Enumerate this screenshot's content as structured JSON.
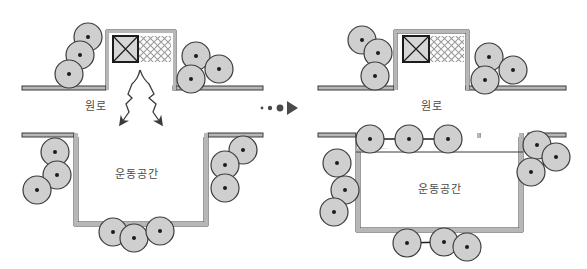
{
  "figure": {
    "type": "architectural-section-diagram",
    "panel_count": 2,
    "transition_marker": "dots-and-arrow"
  },
  "colors": {
    "outline": "#3b3b3b",
    "wall_fill": "#b7b7b7",
    "circle_fill": "#cfcfcf",
    "circle_stroke": "#3b3b3b",
    "text": "#4a4a4a",
    "hatch": "#9a9a9a",
    "background": "#ffffff",
    "arrow_stroke": "#3b3b3b"
  },
  "panels": [
    {
      "id": "left-panel",
      "name": "before-state",
      "upper": {
        "label": "원로",
        "box_label_icon": "crossed-square-icon",
        "hatch_region_name": "mesh-hatch-panel",
        "circle_clusters": [
          {
            "name": "upper-left-cluster",
            "count": 3,
            "circles": [
              {
                "cx": 88,
                "cy": 37,
                "r": 14
              },
              {
                "cx": 80,
                "cy": 55,
                "r": 14
              },
              {
                "cx": 69,
                "cy": 74,
                "r": 14
              }
            ],
            "links": [
              [
                0,
                1
              ],
              [
                1,
                2
              ]
            ]
          },
          {
            "name": "upper-right-cluster",
            "count": 3,
            "circles": [
              {
                "cx": 196,
                "cy": 56,
                "r": 14
              },
              {
                "cx": 191,
                "cy": 79,
                "r": 14
              },
              {
                "cx": 219,
                "cy": 69,
                "r": 14
              }
            ],
            "links": [
              [
                0,
                1
              ],
              [
                0,
                2
              ]
            ]
          }
        ],
        "arrows": [
          {
            "name": "zigzag-arrow-left",
            "direction": "down-left"
          },
          {
            "name": "zigzag-arrow-right",
            "direction": "down-right"
          }
        ]
      },
      "lower": {
        "label": "운동공간",
        "has_top_shelf": false,
        "circle_clusters": [
          {
            "name": "lower-left-cluster",
            "count": 3,
            "circles": [
              {
                "cx": 55,
                "cy": 152,
                "r": 14
              },
              {
                "cx": 57,
                "cy": 175,
                "r": 14
              },
              {
                "cx": 37,
                "cy": 190,
                "r": 14
              }
            ],
            "links": [
              [
                0,
                1
              ],
              [
                1,
                2
              ]
            ]
          },
          {
            "name": "lower-right-cluster",
            "count": 3,
            "circles": [
              {
                "cx": 243,
                "cy": 150,
                "r": 14
              },
              {
                "cx": 225,
                "cy": 165,
                "r": 14
              },
              {
                "cx": 225,
                "cy": 188,
                "r": 14
              }
            ],
            "links": [
              [
                0,
                1
              ],
              [
                1,
                2
              ]
            ]
          },
          {
            "name": "lower-bottom-cluster",
            "count": 3,
            "circles": [
              {
                "cx": 113,
                "cy": 232,
                "r": 14
              },
              {
                "cx": 134,
                "cy": 238,
                "r": 14
              },
              {
                "cx": 160,
                "cy": 231,
                "r": 14
              }
            ],
            "links": [
              [
                0,
                1
              ],
              [
                1,
                2
              ]
            ]
          }
        ]
      }
    },
    {
      "id": "right-panel",
      "name": "after-state",
      "upper": {
        "label": "원로",
        "box_label_icon": "crossed-square-icon",
        "hatch_region_name": "mesh-hatch-panel",
        "circle_clusters": [
          {
            "name": "upper-left-cluster",
            "count": 3,
            "circles": [
              {
                "cx": 362,
                "cy": 40,
                "r": 14
              },
              {
                "cx": 378,
                "cy": 53,
                "r": 14
              },
              {
                "cx": 375,
                "cy": 76,
                "r": 14
              }
            ],
            "links": [
              [
                0,
                1
              ],
              [
                1,
                2
              ]
            ]
          },
          {
            "name": "upper-right-cluster",
            "count": 3,
            "circles": [
              {
                "cx": 489,
                "cy": 57,
                "r": 14
              },
              {
                "cx": 485,
                "cy": 80,
                "r": 14
              },
              {
                "cx": 513,
                "cy": 70,
                "r": 14
              }
            ],
            "links": [
              [
                0,
                1
              ],
              [
                0,
                2
              ]
            ]
          }
        ],
        "arrows": []
      },
      "lower": {
        "label": "운동공간",
        "has_top_shelf": true,
        "circle_clusters": [
          {
            "name": "shelf-row-cluster",
            "count": 3,
            "circles": [
              {
                "cx": 370,
                "cy": 139,
                "r": 14
              },
              {
                "cx": 409,
                "cy": 139,
                "r": 14
              },
              {
                "cx": 448,
                "cy": 139,
                "r": 14
              }
            ],
            "links": [
              [
                0,
                1
              ],
              [
                1,
                2
              ]
            ]
          },
          {
            "name": "lower-left-cluster",
            "count": 3,
            "circles": [
              {
                "cx": 337,
                "cy": 163,
                "r": 14
              },
              {
                "cx": 345,
                "cy": 190,
                "r": 14
              },
              {
                "cx": 334,
                "cy": 212,
                "r": 14
              }
            ],
            "links": [
              [
                0,
                1
              ],
              [
                1,
                2
              ]
            ]
          },
          {
            "name": "lower-right-cluster",
            "count": 3,
            "circles": [
              {
                "cx": 537,
                "cy": 145,
                "r": 14
              },
              {
                "cx": 531,
                "cy": 172,
                "r": 14
              },
              {
                "cx": 556,
                "cy": 157,
                "r": 14
              }
            ],
            "links": [
              [
                0,
                2
              ],
              [
                1,
                2
              ]
            ]
          },
          {
            "name": "lower-bottom-cluster",
            "count": 3,
            "circles": [
              {
                "cx": 407,
                "cy": 243,
                "r": 14
              },
              {
                "cx": 444,
                "cy": 242,
                "r": 14
              },
              {
                "cx": 467,
                "cy": 247,
                "r": 14
              }
            ],
            "links": [
              [
                0,
                1
              ],
              [
                1,
                2
              ]
            ]
          }
        ]
      }
    }
  ],
  "transition": {
    "name": "transition-marker",
    "dots": [
      {
        "cx": 262,
        "cy": 108,
        "r": 1.4
      },
      {
        "cx": 270,
        "cy": 108,
        "r": 2.2
      },
      {
        "cx": 280,
        "cy": 108,
        "r": 3.4
      },
      {
        "cx": 291,
        "cy": 108,
        "r": 0
      }
    ],
    "arrow": "triangle-right"
  }
}
